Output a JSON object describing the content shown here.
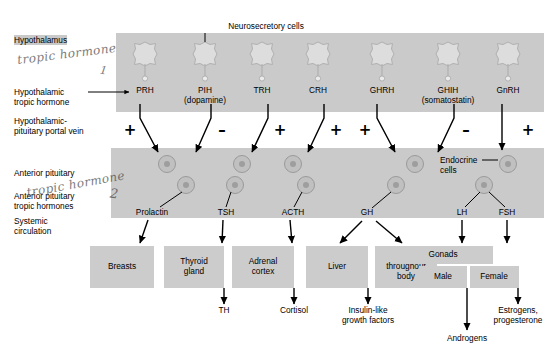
{
  "annotations": {
    "neurosecretory_cells": "Neurosecretory cells",
    "endocrine_cells_line1": "Endocrine",
    "endocrine_cells_line2": "cells"
  },
  "left_labels": {
    "hypothalamus": "Hypothalamus",
    "hypothalamic_tropic_1": "Hypothalamic",
    "hypothalamic_tropic_2": "tropic hormone",
    "portal_vein_1": "Hypothalamic-",
    "portal_vein_2": "pituitary portal vein",
    "anterior_pituitary": "Anterior pituitary",
    "ap_tropic_1": "Anterior pituitary",
    "ap_tropic_2": "tropic hormones",
    "systemic_1": "Systemic",
    "systemic_2": "circulation"
  },
  "handwriting": [
    {
      "text": "tropic hormone",
      "number": "1"
    },
    {
      "text": "tropic hormone",
      "number": "2"
    }
  ],
  "hypothalamic_hormones": [
    {
      "name": "PRH",
      "sub": "",
      "x": 145,
      "sign": "+",
      "sign_x": 130,
      "arrow": "right"
    },
    {
      "name": "PIH",
      "sub": "(dopamine)",
      "x": 205,
      "sign": "–",
      "sign_x": 222,
      "arrow": "left"
    },
    {
      "name": "TRH",
      "sub": "",
      "x": 262,
      "sign": "+",
      "sign_x": 280,
      "arrow": "left"
    },
    {
      "name": "CRH",
      "sub": "",
      "x": 318,
      "sign": "+",
      "sign_x": 336,
      "arrow": "left"
    },
    {
      "name": "GHRH",
      "sub": "",
      "x": 382,
      "sign": "+",
      "sign_x": 365,
      "arrow": "right"
    },
    {
      "name": "GHIH",
      "sub": "(somatostatin)",
      "x": 448,
      "sign": "–",
      "sign_x": 466,
      "arrow": "left"
    },
    {
      "name": "GnRH",
      "sub": "",
      "x": 508,
      "sign": "+",
      "sign_x": 528,
      "arrow": "down"
    }
  ],
  "pituitary_hormones": [
    {
      "name": "Prolactin",
      "x": 152
    },
    {
      "name": "TSH",
      "x": 226
    },
    {
      "name": "ACTH",
      "x": 293
    },
    {
      "name": "GH",
      "x": 367
    },
    {
      "name": "LH",
      "x": 462
    },
    {
      "name": "FSH",
      "x": 507
    }
  ],
  "target_boxes": [
    {
      "label": "Breasts",
      "x": 122,
      "w": 64
    },
    {
      "label": "Thyroid\ngland",
      "x": 194,
      "w": 60
    },
    {
      "label": "Adrenal\ncortex",
      "x": 263,
      "w": 62
    },
    {
      "label": "Liver",
      "x": 337,
      "w": 62
    },
    {
      "label": "Cells\nthroughout\nbody",
      "x": 406,
      "w": 62
    },
    {
      "label": "Gonads",
      "x": 443,
      "w": 100
    }
  ],
  "gonad_subboxes": [
    {
      "label": "Male",
      "x": 443,
      "w": 48
    },
    {
      "label": "Female",
      "x": 494,
      "w": 49
    }
  ],
  "end_products": [
    {
      "label": "TH",
      "x": 224
    },
    {
      "label": "Cortisol",
      "x": 294
    },
    {
      "label": "Insulin-like\ngrowth factors",
      "x": 368
    },
    {
      "label": "Androgens",
      "x": 467
    },
    {
      "label": "Estrogens,\nprogesterone",
      "x": 518
    }
  ],
  "colors": {
    "band": "#cacaca",
    "band_light": "#d6d6d6",
    "box": "#cccccc",
    "ink": "#000000",
    "handwriting": "#4a4a4a"
  }
}
